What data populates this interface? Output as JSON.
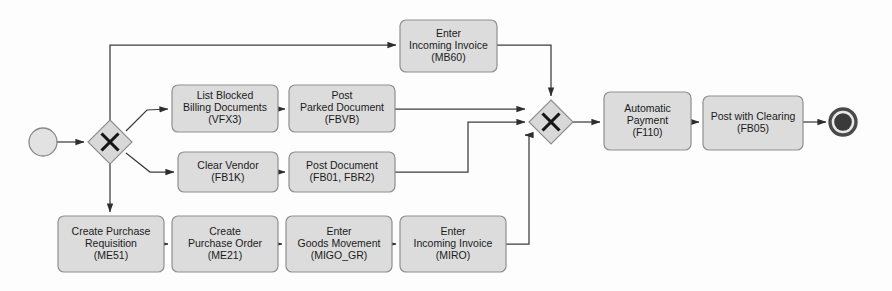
{
  "diagram": {
    "type": "bpmn-process-flow",
    "canvas": {
      "width": 892,
      "height": 291
    },
    "colors": {
      "task_fill": "#dcdcdc",
      "task_stroke": "#8f8f8f",
      "gateway_fill": "#d8d8d8",
      "gateway_stroke": "#8f8f8f",
      "start_fill": "#e2e2e2",
      "end_fill": "#3a3a3a",
      "flow_stroke": "#3c3c3c",
      "text": "#1b1b1b",
      "background": "#fdfdfd"
    },
    "events": [
      {
        "id": "start",
        "kind": "start-event",
        "cx": 43,
        "cy": 142,
        "r": 14
      },
      {
        "id": "end",
        "kind": "end-event",
        "cx": 843,
        "cy": 122,
        "r": 13
      }
    ],
    "gateways": [
      {
        "id": "gw-split",
        "kind": "exclusive-gateway",
        "symbol": "X",
        "cx": 110,
        "cy": 142,
        "half": 22
      },
      {
        "id": "gw-join",
        "kind": "exclusive-gateway",
        "symbol": "X",
        "cx": 551,
        "cy": 122,
        "half": 22
      }
    ],
    "tasks": [
      {
        "id": "mb60",
        "lines": [
          "Enter",
          "Incoming Invoice",
          "(MB60)"
        ],
        "x": 400,
        "y": 20,
        "w": 97,
        "h": 52
      },
      {
        "id": "vfx3",
        "lines": [
          "List Blocked",
          "Billing Documents",
          "(VFX3)"
        ],
        "x": 172,
        "y": 85,
        "w": 106,
        "h": 47
      },
      {
        "id": "fbvb",
        "lines": [
          "Post",
          "Parked Document",
          "(FBVB)"
        ],
        "x": 289,
        "y": 85,
        "w": 106,
        "h": 47
      },
      {
        "id": "f110",
        "lines": [
          "Automatic",
          "Payment",
          "(F110)"
        ],
        "x": 604,
        "y": 92,
        "w": 87,
        "h": 58
      },
      {
        "id": "fb05",
        "lines": [
          "Post with Clearing",
          "(FB05)"
        ],
        "x": 703,
        "y": 96,
        "w": 100,
        "h": 54
      },
      {
        "id": "fb1k",
        "lines": [
          "Clear Vendor",
          "(FB1K)"
        ],
        "x": 178,
        "y": 152,
        "w": 100,
        "h": 40
      },
      {
        "id": "fb01",
        "lines": [
          "Post Document",
          "(FB01, FBR2)"
        ],
        "x": 289,
        "y": 152,
        "w": 106,
        "h": 40
      },
      {
        "id": "me51",
        "lines": [
          "Create Purchase",
          "Requisition",
          "(ME51)"
        ],
        "x": 58,
        "y": 216,
        "w": 106,
        "h": 56
      },
      {
        "id": "me21",
        "lines": [
          "Create",
          "Purchase Order",
          "(ME21)"
        ],
        "x": 172,
        "y": 216,
        "w": 106,
        "h": 56
      },
      {
        "id": "migo",
        "lines": [
          "Enter",
          "Goods Movement",
          "(MIGO_GR)"
        ],
        "x": 286,
        "y": 216,
        "w": 106,
        "h": 56
      },
      {
        "id": "miro",
        "lines": [
          "Enter",
          "Incoming Invoice",
          "(MIRO)"
        ],
        "x": 400,
        "y": 216,
        "w": 106,
        "h": 56
      }
    ],
    "flows": [
      {
        "id": "f-start-gw",
        "from": "start",
        "to": "gw-split",
        "points": "57,142 84,142",
        "arrow": true
      },
      {
        "id": "f-gw-mb60",
        "from": "gw-split",
        "to": "mb60",
        "points": "110,120 110,45 396,45",
        "arrow": true
      },
      {
        "id": "f-gw-vfx3",
        "from": "gw-split",
        "to": "vfx3",
        "points": "126,131 147,110 168,109",
        "arrow": true
      },
      {
        "id": "f-gw-fb1k",
        "from": "gw-split",
        "to": "fb1k",
        "points": "126,153 150,172 174,172",
        "arrow": true
      },
      {
        "id": "f-gw-me51",
        "from": "gw-split",
        "to": "me51",
        "points": "110,164 110,212",
        "arrow": true
      },
      {
        "id": "f-vfx3-fbvb",
        "from": "vfx3",
        "to": "fbvb",
        "points": "278,109 285,109",
        "arrow": true
      },
      {
        "id": "f-fbvb-join",
        "from": "fbvb",
        "to": "gw-join",
        "points": "395,109 525,109",
        "arrow": true
      },
      {
        "id": "f-fb1k-fb01",
        "from": "fb1k",
        "to": "fb01",
        "points": "278,172 285,172",
        "arrow": true
      },
      {
        "id": "f-fb01-join",
        "from": "fb01",
        "to": "gw-join",
        "points": "395,172 468,172 468,122 525,122",
        "arrow": true
      },
      {
        "id": "f-me51-me21",
        "from": "me51",
        "to": "me21",
        "points": "164,244 168,244",
        "arrow": true
      },
      {
        "id": "f-me21-migo",
        "from": "me21",
        "to": "migo",
        "points": "278,244 282,244",
        "arrow": true
      },
      {
        "id": "f-migo-miro",
        "from": "migo",
        "to": "miro",
        "points": "392,244 396,244",
        "arrow": true
      },
      {
        "id": "f-miro-join",
        "from": "miro",
        "to": "gw-join",
        "points": "506,244 529,244 529,135 525,135",
        "arrow": true
      },
      {
        "id": "f-mb60-join",
        "from": "mb60",
        "to": "gw-join",
        "points": "497,45 551,45 551,96",
        "arrow": true
      },
      {
        "id": "f-join-f110",
        "from": "gw-join",
        "to": "f110",
        "points": "573,122 600,122",
        "arrow": true
      },
      {
        "id": "f-f110-fb05",
        "from": "f110",
        "to": "fb05",
        "points": "691,122 699,122",
        "arrow": true
      },
      {
        "id": "f-fb05-end",
        "from": "fb05",
        "to": "end",
        "points": "803,122 826,122",
        "arrow": true
      }
    ]
  }
}
